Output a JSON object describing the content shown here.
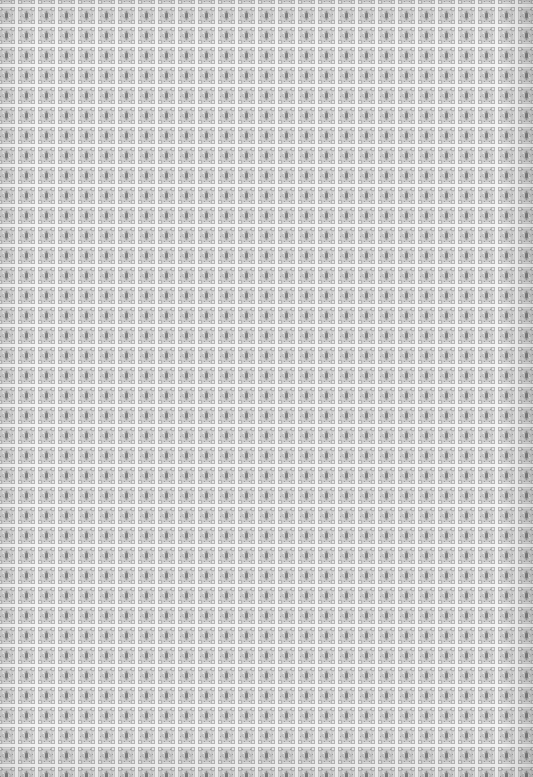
{
  "image": {
    "description": "Repeating ornamental square tile pattern, grayscale, on white grid lines",
    "tile_pitch_px": 20,
    "tile_size_px": 17,
    "grid_offset": {
      "x": -3,
      "y": 6
    },
    "colors": {
      "background": "#f3f3f3",
      "tile_base": "#c9c9c9",
      "tile_mid": "#a8a8a8",
      "tile_dark": "#7c7c7c",
      "tile_light": "#e2e2e2"
    }
  }
}
